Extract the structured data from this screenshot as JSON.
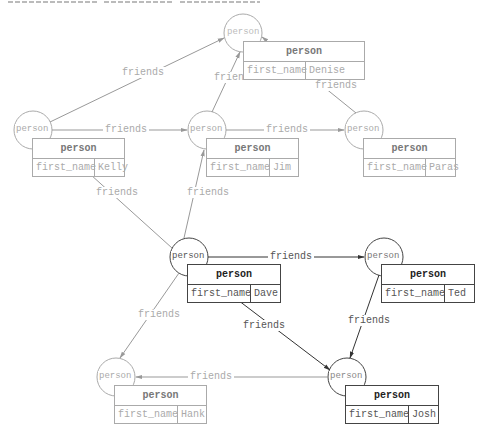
{
  "diagram": {
    "type": "graph",
    "edge_label_default": "friends",
    "node_type_label": "person",
    "colors": {
      "faded_stroke": "#aaaaaa",
      "faded_text": "#aaaaaa",
      "strong_stroke": "#444444",
      "strong_text": "#222222",
      "background": "#ffffff"
    },
    "nodes": [
      {
        "id": "denise",
        "circle_label": "person",
        "type": "person",
        "field": "first_name",
        "value": "Denise",
        "style": "faded"
      },
      {
        "id": "kelly",
        "circle_label": "person",
        "type": "person",
        "field": "first_name",
        "value": "Kelly",
        "style": "faded"
      },
      {
        "id": "jim",
        "circle_label": "person",
        "type": "person",
        "field": "first_name",
        "value": "Jim",
        "style": "faded"
      },
      {
        "id": "paras",
        "circle_label": "person",
        "type": "person",
        "field": "first_name",
        "value": "Paras",
        "style": "faded"
      },
      {
        "id": "dave",
        "circle_label": "person",
        "type": "person",
        "field": "first_name",
        "value": "Dave",
        "style": "strong"
      },
      {
        "id": "ted",
        "circle_label": "person",
        "type": "person",
        "field": "first_name",
        "value": "Ted",
        "style": "strong"
      },
      {
        "id": "hank",
        "circle_label": "person",
        "type": "person",
        "field": "first_name",
        "value": "Hank",
        "style": "faded"
      },
      {
        "id": "josh",
        "circle_label": "person",
        "type": "person",
        "field": "first_name",
        "value": "Josh",
        "style": "strong"
      }
    ],
    "edges": [
      {
        "from": "kelly",
        "to": "denise",
        "label": "friends",
        "style": "faded"
      },
      {
        "from": "kelly",
        "to": "jim",
        "label": "friends",
        "style": "faded"
      },
      {
        "from": "jim",
        "to": "denise",
        "label": "friends",
        "style": "faded"
      },
      {
        "from": "jim",
        "to": "paras",
        "label": "friends",
        "style": "faded"
      },
      {
        "from": "paras",
        "to": "denise",
        "label": "friends",
        "style": "faded"
      },
      {
        "from": "dave",
        "to": "kelly",
        "label": "friends",
        "style": "faded"
      },
      {
        "from": "dave",
        "to": "jim",
        "label": "friends",
        "style": "faded"
      },
      {
        "from": "dave",
        "to": "ted",
        "label": "friends",
        "style": "strong"
      },
      {
        "from": "dave",
        "to": "hank",
        "label": "friends",
        "style": "faded"
      },
      {
        "from": "dave",
        "to": "josh",
        "label": "friends",
        "style": "strong"
      },
      {
        "from": "ted",
        "to": "josh",
        "label": "friends",
        "style": "strong"
      },
      {
        "from": "josh",
        "to": "hank",
        "label": "friends",
        "style": "faded"
      }
    ]
  }
}
